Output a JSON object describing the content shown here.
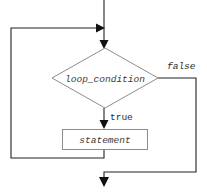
{
  "diagram": {
    "type": "flowchart",
    "background_color": "#ffffff",
    "line_color": "#222222",
    "node_border_color": "#8d8d8d",
    "node_fill_color": "#ffffff",
    "text_color": "#3a3a3a",
    "nodes": [
      {
        "id": "condition",
        "shape": "diamond",
        "label": "loop_condition",
        "cx": 105,
        "cy": 78,
        "half_width": 53,
        "half_height": 30
      },
      {
        "id": "statement",
        "shape": "rectangle",
        "label": "statement",
        "x": 62,
        "y": 129,
        "width": 86,
        "height": 21
      }
    ],
    "edges": [
      {
        "id": "entry",
        "from": "start",
        "to": "condition",
        "label": "",
        "path": "M104,0 L104,46"
      },
      {
        "id": "loop-back",
        "from": "statement",
        "to": "condition",
        "label": "",
        "path": "M104,150 L104,158 L11,158 L11,28 L101,28"
      },
      {
        "id": "true-branch",
        "from": "condition",
        "to": "statement",
        "label": "true",
        "path": "M104,108 L104,126"
      },
      {
        "id": "false-branch",
        "from": "condition",
        "to": "exit",
        "label": "false",
        "path": "M158,78 L196,78 L196,172 L104,172 L104,177"
      }
    ],
    "edge_labels": [
      {
        "id": "label-false",
        "text": "false",
        "x": 167,
        "y": 66
      },
      {
        "id": "label-true",
        "text": "true",
        "x": 110,
        "y": 116
      }
    ]
  }
}
